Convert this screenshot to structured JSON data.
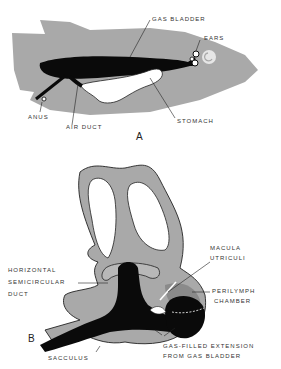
{
  "figure": {
    "panels": [
      {
        "id": "A",
        "label": "A",
        "subject": "fish-body-with-gas-bladder",
        "annotations": [
          {
            "text": "GAS BLADDER",
            "target": "gas-bladder"
          },
          {
            "text": "EARS",
            "target": "ears"
          },
          {
            "text": "ANUS",
            "target": "anus"
          },
          {
            "text": "AIR DUCT",
            "target": "air-duct"
          },
          {
            "text": "STOMACH",
            "target": "stomach"
          }
        ]
      },
      {
        "id": "B",
        "label": "B",
        "subject": "inner-ear-with-gas-extension",
        "annotations": [
          {
            "text_lines": [
              "MACULA",
              "UTRICULI"
            ],
            "target": "macula-utriculi"
          },
          {
            "text_lines": [
              "HORIZONTAL",
              "SEMICIRCULAR",
              "DUCT"
            ],
            "target": "horizontal-semicircular-duct"
          },
          {
            "text_lines": [
              "PERILYMPH",
              "CHAMBER"
            ],
            "target": "perilymph-chamber"
          },
          {
            "text_lines": [
              "GAS-FILLED EXTENSION",
              "FROM GAS BLADDER"
            ],
            "target": "gas-filled-extension"
          },
          {
            "text": "SACCULUS",
            "target": "sacculus"
          }
        ]
      }
    ],
    "colors": {
      "body_gray": "#a9a9a9",
      "dark_fill": "#0a0a0a",
      "white_fill": "#ffffff",
      "outline": "#222222",
      "chamber_gray": "#8a8a8a"
    }
  }
}
